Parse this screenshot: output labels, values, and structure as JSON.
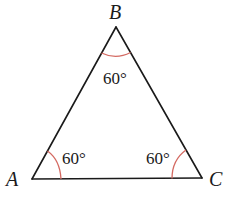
{
  "diagram": {
    "type": "equilateral-triangle",
    "vertices": [
      {
        "id": "A",
        "label": "A"
      },
      {
        "id": "B",
        "label": "B"
      },
      {
        "id": "C",
        "label": "C"
      }
    ],
    "angles": [
      {
        "vertex": "A",
        "label": "60°"
      },
      {
        "vertex": "B",
        "label": "60°"
      },
      {
        "vertex": "C",
        "label": "60°"
      }
    ],
    "colors": {
      "sides": "#1a1a1a",
      "angle_arcs": "#d46a62"
    }
  }
}
